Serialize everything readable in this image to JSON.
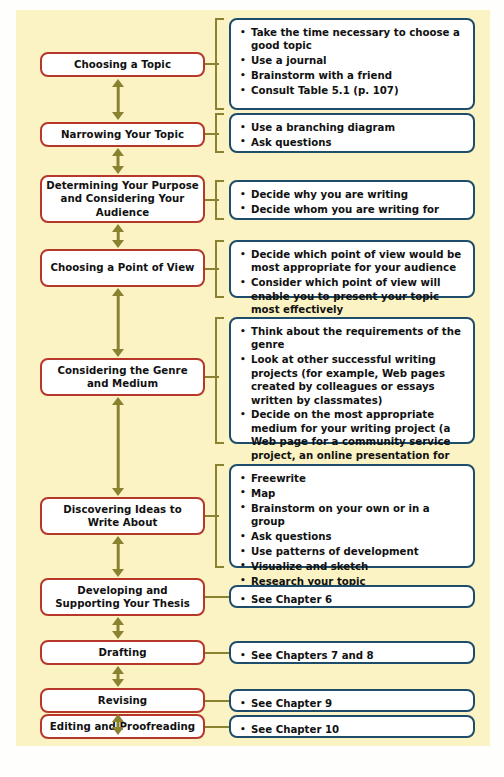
{
  "diagram": {
    "panel_color": "#fbf3c3",
    "stage_border_color": "#b8372b",
    "detail_border_color": "#1e4d6b",
    "connector_color": "#8a8231",
    "rows": [
      {
        "stage": "Choosing a Topic",
        "connector": "bracket",
        "details": [
          "Take the time necessary to choose a good topic",
          "Use a journal",
          "Brainstorm with a friend",
          "Consult Table 5.1 (p. 107)"
        ]
      },
      {
        "stage": "Narrowing Your Topic",
        "connector": "bracket",
        "details": [
          "Use a branching diagram",
          "Ask questions"
        ]
      },
      {
        "stage": "Determining Your Purpose and Considering Your Audience",
        "connector": "bracket",
        "details": [
          "Decide why you are writing",
          "Decide whom you are writing for"
        ]
      },
      {
        "stage": "Choosing a Point of View",
        "connector": "bracket",
        "details": [
          "Decide which point of view would be most appropriate for your audience",
          "Consider which point of view will enable you to present your topic most effectively"
        ]
      },
      {
        "stage": "Considering the Genre and Medium",
        "connector": "bracket",
        "details": [
          "Think about the requirements of the genre",
          "Look at other successful writing projects (for example, Web pages created by colleagues or essays written by classmates)",
          "Decide on the most appropriate medium for your writing project (a Web page for a community service project, an online presentation for your speech class, a “paper” submitted digitally or in print for your composition class)"
        ]
      },
      {
        "stage": "Discovering Ideas to Write About",
        "connector": "bracket",
        "details": [
          "Freewrite",
          "Map",
          "Brainstorm on your own or in a group",
          "Ask questions",
          "Use patterns of development",
          "Visualize and sketch",
          "Research your topic"
        ]
      },
      {
        "stage": "Developing and Supporting Your Thesis",
        "connector": "line",
        "details": [
          "See Chapter 6"
        ]
      },
      {
        "stage": "Drafting",
        "connector": "line",
        "details": [
          "See Chapters 7 and 8"
        ]
      },
      {
        "stage": "Revising",
        "connector": "line",
        "details": [
          "See Chapter 9"
        ]
      },
      {
        "stage": "Editing and Proofreading",
        "connector": "line",
        "details": [
          "See Chapter 10"
        ]
      }
    ]
  }
}
